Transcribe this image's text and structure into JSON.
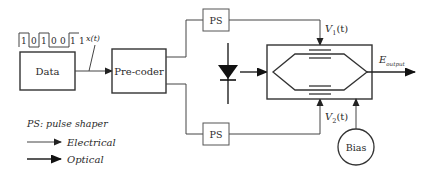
{
  "diagram": {
    "bit_sequence": [
      "1",
      "0",
      "1",
      "0",
      "0",
      "1",
      "1"
    ],
    "signal_label": "x(t)",
    "blocks": {
      "data": "Data",
      "precoder": "Pre-coder",
      "ps_top": "PS",
      "ps_bottom": "PS",
      "bias": "Bias"
    },
    "labels": {
      "v1_main": "V",
      "v1_sub": "1",
      "v1_tail": "(t)",
      "v2_main": "V",
      "v2_sub": "2",
      "v2_tail": "(t)",
      "e_main": "E",
      "e_sub": "output"
    },
    "legend": {
      "ps_note": "PS: pulse shaper",
      "electrical": "Electrical",
      "optical": "Optical"
    }
  }
}
